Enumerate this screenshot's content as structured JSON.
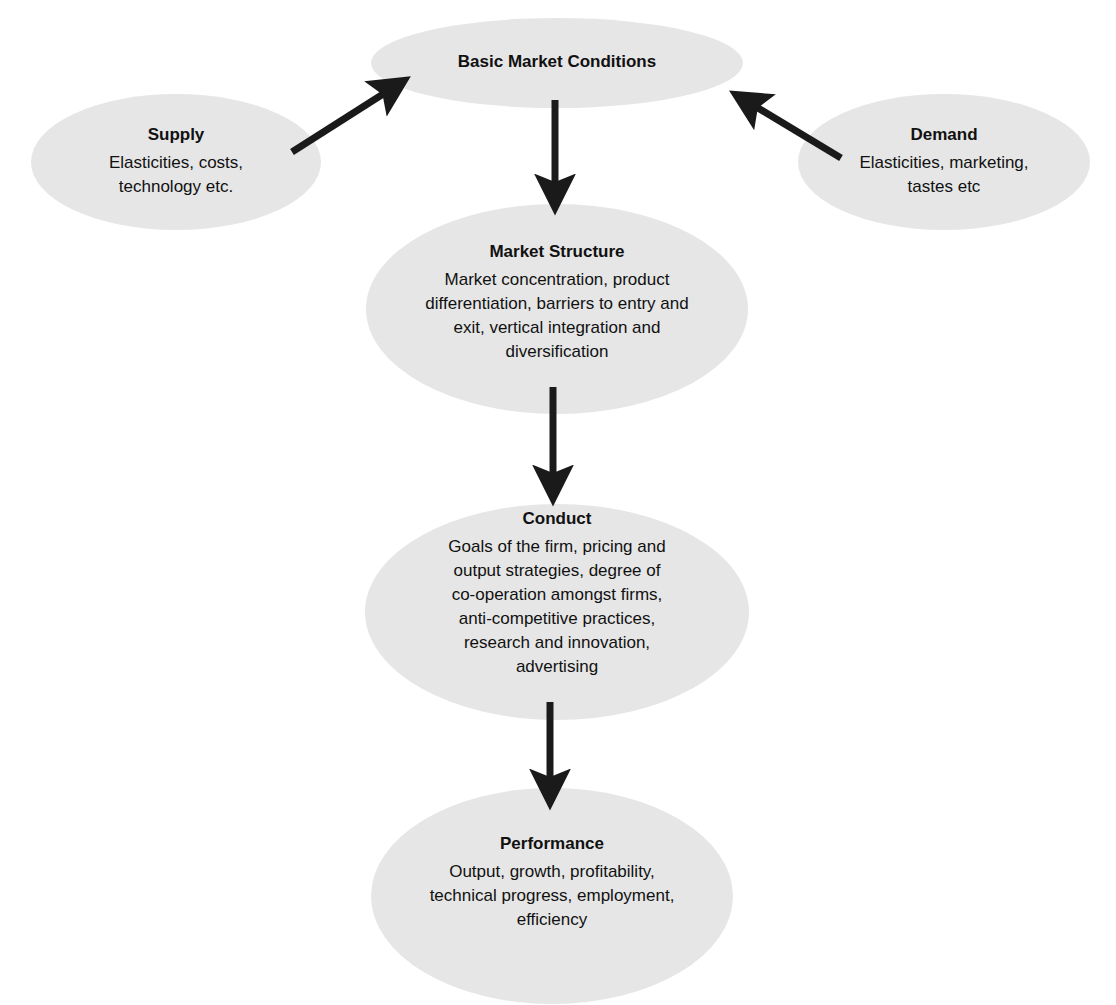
{
  "diagram": {
    "type": "flowchart",
    "fill_color": "#e6e6e6",
    "arrow_color": "#1a1a1a",
    "nodes": {
      "basic": {
        "title": "Basic Market Conditions",
        "desc": ""
      },
      "supply": {
        "title": "Supply",
        "desc": "Elasticities, costs,\ntechnology etc."
      },
      "demand": {
        "title": "Demand",
        "desc": "Elasticities, marketing,\ntastes etc"
      },
      "structure": {
        "title": "Market Structure",
        "desc": "Market concentration, product\ndifferentiation, barriers to entry and\nexit, vertical integration and\ndiversification"
      },
      "conduct": {
        "title": "Conduct",
        "desc": "Goals of the firm, pricing and\noutput strategies, degree of\nco-operation amongst firms,\nanti-competitive practices,\nresearch and innovation,\nadvertising"
      },
      "performance": {
        "title": "Performance",
        "desc": "Output, growth, profitability,\ntechnical progress, employment,\nefficiency"
      }
    },
    "edges": [
      {
        "from": "Supply",
        "to": "Basic Market Conditions"
      },
      {
        "from": "Demand",
        "to": "Basic Market Conditions"
      },
      {
        "from": "Basic Market Conditions",
        "to": "Market Structure"
      },
      {
        "from": "Market Structure",
        "to": "Conduct"
      },
      {
        "from": "Conduct",
        "to": "Performance"
      }
    ]
  }
}
